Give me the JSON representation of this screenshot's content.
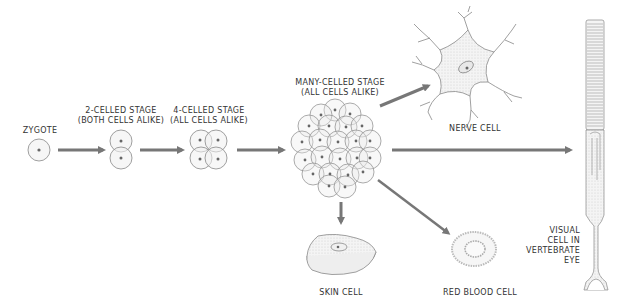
{
  "colors": {
    "arrow": "#777777",
    "outline": "#888888",
    "nucleus": "#666666",
    "fill": "#f3f3f3",
    "text": "#333333"
  },
  "stages": [
    {
      "id": "zygote",
      "label_line1": "ZYGOTE",
      "label_line2": ""
    },
    {
      "id": "two-celled",
      "label_line1": "2-CELLED STAGE",
      "label_line2": "(BOTH CELLS ALIKE)"
    },
    {
      "id": "four-celled",
      "label_line1": "4-CELLED STAGE",
      "label_line2": "(ALL CELLS ALIKE)"
    },
    {
      "id": "many-celled",
      "label_line1": "MANY-CELLED STAGE",
      "label_line2": "(ALL CELLS ALIKE)"
    }
  ],
  "specialized_cells": [
    {
      "id": "nerve",
      "label": "NERVE CELL"
    },
    {
      "id": "skin",
      "label": "SKIN CELL"
    },
    {
      "id": "red-blood",
      "label": "RED BLOOD CELL"
    },
    {
      "id": "visual",
      "label_lines": [
        "VISUAL",
        "CELL IN",
        "VERTEBRATE",
        "EYE"
      ]
    }
  ]
}
